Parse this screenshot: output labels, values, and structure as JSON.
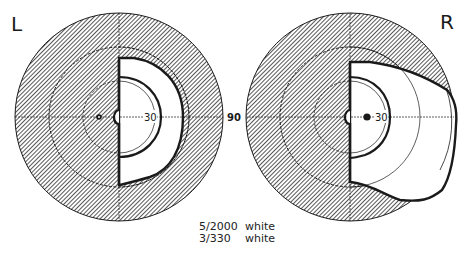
{
  "figure": {
    "type": "visual-field-perimetry",
    "left_eye": {
      "label": "L",
      "ring_labels": {
        "inner": "30"
      },
      "blind_spot": "marked"
    },
    "right_eye": {
      "label": "R",
      "ring_labels": {
        "inner": "30",
        "outer": "90"
      },
      "blind_spot": "marked"
    },
    "rings_degrees": [
      30,
      60,
      90
    ],
    "legend": [
      {
        "stimulus": "5/2000",
        "color": "white",
        "line": "thick outer isopter"
      },
      {
        "stimulus": "3/330",
        "color": "white",
        "line": "inner isopter"
      }
    ],
    "colors": {
      "ink": "#1a1a1a",
      "hatch": "#555555",
      "background": "#ffffff"
    }
  }
}
